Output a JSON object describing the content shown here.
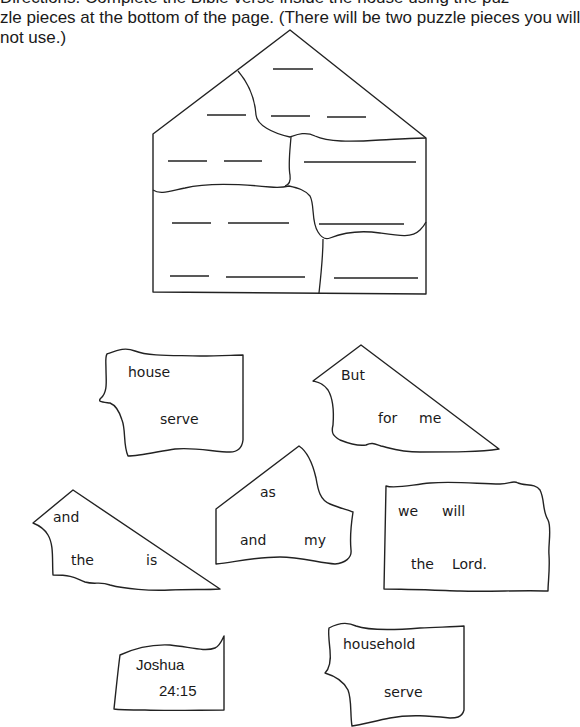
{
  "instructions": {
    "line1": "Directions: Complete the Bible verse inside the house using the puz-",
    "line2": "zle pieces at the bottom of the page. (There will be two puzzle pieces you will",
    "line3": "not use.)"
  },
  "house": {
    "rows": [
      {
        "blanks": 1
      },
      {
        "blanks": 3
      },
      {
        "blanks": 3
      },
      {
        "blanks": 3
      },
      {
        "blanks": 3
      }
    ]
  },
  "pieces": [
    {
      "id": "house-serve",
      "words": [
        "house",
        "serve"
      ]
    },
    {
      "id": "but-for-me",
      "words": [
        "But",
        "for",
        "me"
      ]
    },
    {
      "id": "and-the-is",
      "words": [
        "and",
        "the",
        "is"
      ]
    },
    {
      "id": "as-and-my",
      "words": [
        "as",
        "and",
        "my"
      ]
    },
    {
      "id": "we-will-the-lord",
      "words": [
        "we",
        "will",
        "the",
        "Lord."
      ]
    },
    {
      "id": "joshua-ref",
      "words": [
        "Joshua",
        "24:15"
      ]
    },
    {
      "id": "household-serve",
      "words": [
        "household",
        "serve"
      ]
    }
  ]
}
